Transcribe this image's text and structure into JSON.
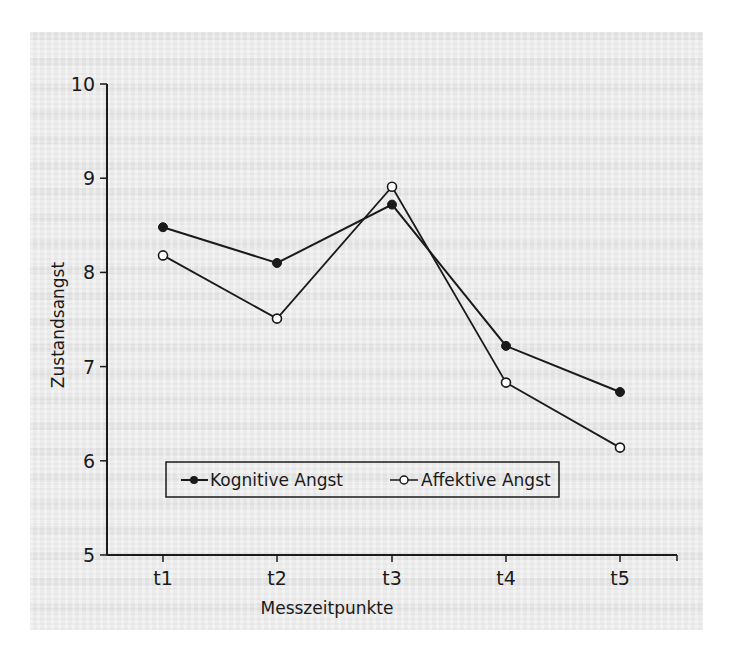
{
  "chart_data": {
    "type": "line",
    "title": "",
    "xlabel": "Messzeitpunkte",
    "ylabel": "Zustandsangst",
    "categories": [
      "t1",
      "t2",
      "t3",
      "t4",
      "t5"
    ],
    "ylim": [
      5,
      10
    ],
    "yticks": [
      "5",
      "6",
      "7",
      "8",
      "9",
      "10"
    ],
    "grid": false,
    "legend_position": "inside-bottom",
    "series": [
      {
        "name": "Kognitive Angst",
        "marker": "filled-circle",
        "values": [
          8.48,
          8.1,
          8.72,
          7.22,
          6.73
        ]
      },
      {
        "name": "Affektive Angst",
        "marker": "open-circle",
        "values": [
          8.18,
          7.51,
          8.91,
          6.83,
          6.14
        ]
      }
    ]
  },
  "colors": {
    "line": "#1a1a1a",
    "paper": "#ececec",
    "open_marker_fill": "#ffffff"
  }
}
